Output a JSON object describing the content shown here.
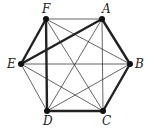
{
  "diagram": {
    "vertices": [
      {
        "id": "A",
        "label": "A"
      },
      {
        "id": "B",
        "label": "B"
      },
      {
        "id": "C",
        "label": "C"
      },
      {
        "id": "D",
        "label": "D"
      },
      {
        "id": "E",
        "label": "E"
      },
      {
        "id": "F",
        "label": "F"
      }
    ],
    "highlighted_edges": [
      [
        "E",
        "F"
      ],
      [
        "F",
        "D"
      ],
      [
        "D",
        "C"
      ],
      [
        "C",
        "B"
      ],
      [
        "B",
        "A"
      ],
      [
        "A",
        "E"
      ]
    ],
    "thin_edges": [
      [
        "F",
        "A"
      ],
      [
        "E",
        "B"
      ],
      [
        "E",
        "D"
      ],
      [
        "E",
        "C"
      ],
      [
        "F",
        "B"
      ],
      [
        "F",
        "C"
      ],
      [
        "A",
        "D"
      ],
      [
        "A",
        "C"
      ],
      [
        "B",
        "D"
      ]
    ],
    "colors": {
      "edge": "#222222",
      "vertex": "#111111"
    }
  }
}
